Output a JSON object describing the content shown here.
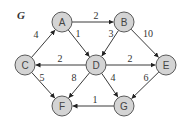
{
  "title": "G",
  "colors": {
    "node_fill": "#d4d4d4",
    "node_stroke": "#5a5a5a",
    "edge": "#3a3a3a",
    "text": "#333333"
  },
  "nodes": [
    {
      "id": "A",
      "label": "A",
      "x": 62,
      "y": 22
    },
    {
      "id": "B",
      "label": "B",
      "x": 124,
      "y": 22
    },
    {
      "id": "C",
      "label": "C",
      "x": 25,
      "y": 65
    },
    {
      "id": "D",
      "label": "D",
      "x": 96,
      "y": 65
    },
    {
      "id": "E",
      "label": "E",
      "x": 166,
      "y": 65
    },
    {
      "id": "F",
      "label": "F",
      "x": 62,
      "y": 106
    },
    {
      "id": "G",
      "label": "G",
      "x": 124,
      "y": 106
    }
  ],
  "edges": [
    {
      "from": "C",
      "to": "A",
      "weight": "4",
      "lx": 36,
      "ly": 34
    },
    {
      "from": "A",
      "to": "B",
      "weight": "2",
      "lx": 96,
      "ly": 15
    },
    {
      "from": "A",
      "to": "D",
      "weight": "1",
      "lx": 78,
      "ly": 33
    },
    {
      "from": "B",
      "to": "D",
      "weight": "3",
      "lx": 111,
      "ly": 33
    },
    {
      "from": "B",
      "to": "E",
      "weight": "10",
      "lx": 148,
      "ly": 33
    },
    {
      "from": "D",
      "to": "C",
      "weight": "2",
      "lx": 60,
      "ly": 58
    },
    {
      "from": "D",
      "to": "E",
      "weight": "2",
      "lx": 130,
      "ly": 58
    },
    {
      "from": "C",
      "to": "F",
      "weight": "5",
      "lx": 42,
      "ly": 77
    },
    {
      "from": "D",
      "to": "F",
      "weight": "8",
      "lx": 74,
      "ly": 77
    },
    {
      "from": "D",
      "to": "G",
      "weight": "4",
      "lx": 113,
      "ly": 77
    },
    {
      "from": "E",
      "to": "G",
      "weight": "6",
      "lx": 146,
      "ly": 77
    },
    {
      "from": "G",
      "to": "F",
      "weight": "1",
      "lx": 95,
      "ly": 99
    }
  ]
}
